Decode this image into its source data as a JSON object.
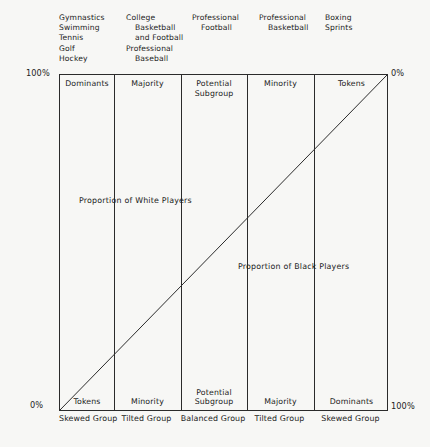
{
  "figure": {
    "type": "diagram",
    "kind": "proportional-continuum-chart",
    "axis": {
      "top_left_percent": "100%",
      "top_right_percent": "0%",
      "bottom_left_percent": "0%",
      "bottom_right_percent": "100%"
    },
    "annotations": {
      "white_players": "Proportion of White Players",
      "black_players": "Proportion of Black Players"
    },
    "diagonal": {
      "from": "bottom-left",
      "to": "top-right",
      "color": "#2b2b2b"
    },
    "colors": {
      "background": "#f7f7f5",
      "line": "#2b2b2b",
      "text": "#232323"
    },
    "columns": [
      {
        "sports": [
          "Gymnastics",
          "Swimming",
          "Tennis",
          "Golf",
          "Hockey"
        ],
        "sports_indent": [
          false,
          false,
          false,
          false,
          false
        ],
        "top_label": "Dominants",
        "bottom_label": "Tokens",
        "group_type": "Skewed Group"
      },
      {
        "sports": [
          "College",
          "Basketball",
          "and Football",
          "Professional",
          "Baseball"
        ],
        "sports_indent": [
          false,
          true,
          true,
          false,
          true
        ],
        "top_label": "Majority",
        "bottom_label": "Minority",
        "group_type": "Tilted Group"
      },
      {
        "sports": [
          "Professional",
          "Football"
        ],
        "sports_indent": [
          false,
          true
        ],
        "top_label": "Potential\nSubgroup",
        "bottom_label": "Potential\nSubgroup",
        "group_type": "Balanced Group"
      },
      {
        "sports": [
          "Professional",
          "Basketball"
        ],
        "sports_indent": [
          false,
          true
        ],
        "top_label": "Minority",
        "bottom_label": "Majority",
        "group_type": "Tilted Group"
      },
      {
        "sports": [
          "Boxing",
          "Sprints"
        ],
        "sports_indent": [
          false,
          false
        ],
        "top_label": "Tokens",
        "bottom_label": "Dominants",
        "group_type": "Skewed Group"
      }
    ]
  }
}
